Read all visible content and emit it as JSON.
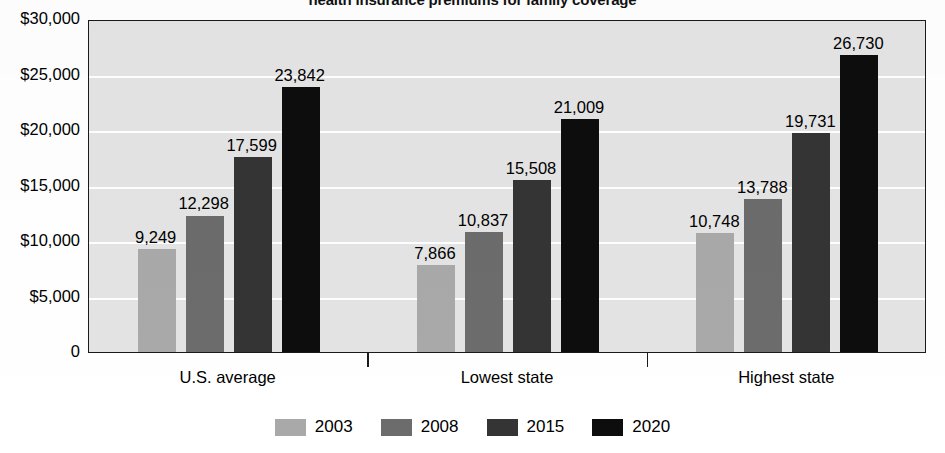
{
  "chart_data": {
    "type": "bar",
    "title": "health insurance premiums for family coverage",
    "subtitle": "",
    "xlabel": "",
    "ylabel": "",
    "categories": [
      "U.S. average",
      "Lowest state",
      "Highest state"
    ],
    "series": [
      {
        "name": "2003",
        "color": "#a9a9a9",
        "values": [
          9249,
          7866,
          10748
        ],
        "labels": [
          "9,249",
          "7,866",
          "10,748"
        ]
      },
      {
        "name": "2008",
        "color": "#6c6c6c",
        "values": [
          12298,
          10837,
          13788
        ],
        "labels": [
          "12,298",
          "10,837",
          "13,788"
        ]
      },
      {
        "name": "2015",
        "color": "#343434",
        "values": [
          17599,
          15508,
          19731
        ],
        "labels": [
          "17,599",
          "15,508",
          "19,731"
        ]
      },
      {
        "name": "2020",
        "color": "#0d0d0d",
        "values": [
          23842,
          21009,
          26730
        ],
        "labels": [
          "23,842",
          "21,009",
          "26,730"
        ]
      }
    ],
    "ylim": [
      0,
      30000
    ],
    "ytick_values": [
      0,
      5000,
      10000,
      15000,
      20000,
      25000,
      30000
    ],
    "ytick_labels": [
      "0",
      "$5,000",
      "$10,000",
      "$15,000",
      "$20,000",
      "$25,000",
      "$30,000"
    ],
    "grid": true,
    "legend_position": "bottom",
    "plot_background": "#e4e4e4",
    "gridline_color": "#ffffff",
    "axis_color": "#1a1a1a"
  },
  "legend": {
    "items": [
      {
        "label": "2003"
      },
      {
        "label": "2008"
      },
      {
        "label": "2015"
      },
      {
        "label": "2020"
      }
    ]
  }
}
